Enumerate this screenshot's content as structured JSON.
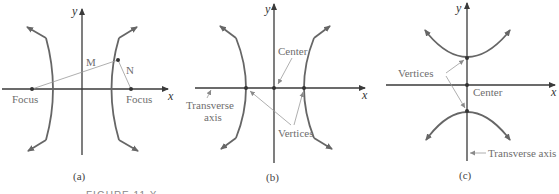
{
  "figure": {
    "caption_partial": "FIGURE 11.X",
    "panels": [
      {
        "id": "a",
        "caption": "(a)",
        "axis_labels": {
          "x": "x",
          "y": "y"
        },
        "labels": {
          "focus_left": "Focus",
          "focus_right": "Focus",
          "m": "M",
          "n": "N"
        }
      },
      {
        "id": "b",
        "caption": "(b)",
        "axis_labels": {
          "x": "x",
          "y": "y"
        },
        "labels": {
          "center": "Center",
          "transverse_1": "Transverse",
          "transverse_2": "axis",
          "vertices": "Vertices"
        }
      },
      {
        "id": "c",
        "caption": "(c)",
        "axis_labels": {
          "x": "x",
          "y": "y"
        },
        "labels": {
          "vertices": "Vertices",
          "center": "Center",
          "transverse": "Transverse axis"
        }
      }
    ]
  },
  "colors": {
    "axis": "#3a3a3a",
    "curve": "#666666",
    "label": "#6e6e6e",
    "thin_line": "#9a9a9a"
  }
}
